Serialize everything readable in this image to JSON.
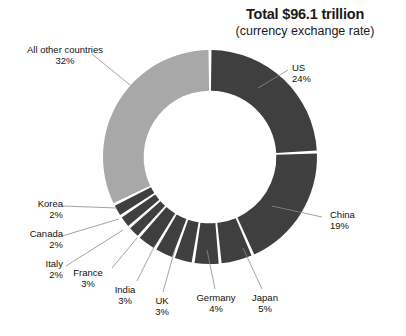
{
  "title": {
    "main": "Total $96.1 trillion",
    "sub": "(currency exchange rate)"
  },
  "colors": {
    "dark_slice": "#3f3f3f",
    "light_slice": "#a8a8a8",
    "background": "#ffffff",
    "leader_line": "#8c8c8c",
    "text": "#111111"
  },
  "labels": {
    "us": {
      "name": "US",
      "pct": "24%"
    },
    "china": {
      "name": "China",
      "pct": "19%"
    },
    "japan": {
      "name": "Japan",
      "pct": "5%"
    },
    "germany": {
      "name": "Germany",
      "pct": "4%"
    },
    "uk": {
      "name": "UK",
      "pct": "3%"
    },
    "india": {
      "name": "India",
      "pct": "3%"
    },
    "france": {
      "name": "France",
      "pct": "3%"
    },
    "italy": {
      "name": "Italy",
      "pct": "2%"
    },
    "canada": {
      "name": "Canada",
      "pct": "2%"
    },
    "korea": {
      "name": "Korea",
      "pct": "2%"
    },
    "other": {
      "name": "All other countries",
      "pct": "32%"
    }
  },
  "chart_data": {
    "type": "pie",
    "variant": "donut",
    "title": "Total $96.1 trillion",
    "subtitle": "(currency exchange rate)",
    "unit": "percent of world GDP",
    "total_label": "$96.1 trillion",
    "xlabel": "",
    "ylabel": "",
    "legend_position": "callout-labels",
    "grid": false,
    "start_angle_deg": 0,
    "direction": "clockwise",
    "inner_radius_ratio": 0.62,
    "categories": [
      "US",
      "China",
      "Japan",
      "Germany",
      "UK",
      "India",
      "France",
      "Italy",
      "Canada",
      "Korea",
      "All other countries"
    ],
    "values": [
      24,
      19,
      5,
      4,
      3,
      3,
      3,
      2,
      2,
      2,
      32
    ],
    "slice_colors": [
      "#3f3f3f",
      "#3f3f3f",
      "#3f3f3f",
      "#3f3f3f",
      "#3f3f3f",
      "#3f3f3f",
      "#3f3f3f",
      "#3f3f3f",
      "#3f3f3f",
      "#3f3f3f",
      "#a8a8a8"
    ],
    "labels_shown": [
      "US 24%",
      "China 19%",
      "Japan 5%",
      "Germany 4%",
      "UK 3%",
      "India 3%",
      "France 3%",
      "Italy 2%",
      "Canada 2%",
      "Korea 2%",
      "All other countries 32%"
    ]
  }
}
